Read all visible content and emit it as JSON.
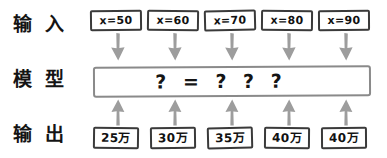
{
  "diagram": {
    "type": "flow",
    "title": "",
    "rows": [
      {
        "id": "input",
        "label": "输 入"
      },
      {
        "id": "model",
        "label": "模 型"
      },
      {
        "id": "output",
        "label": "输 出"
      }
    ],
    "model": {
      "expression": "? = ? ? ?",
      "border_color": "#8a8a8a"
    },
    "arrow_color": "#9d9d9d",
    "box_border_color": "#3a3a3a",
    "columns": [
      {
        "input": "x=50",
        "output": "25万"
      },
      {
        "input": "x=60",
        "output": "30万"
      },
      {
        "input": "x=70",
        "output": "35万"
      },
      {
        "input": "x=80",
        "output": "40万"
      },
      {
        "input": "x=90",
        "output": "40万"
      }
    ]
  }
}
